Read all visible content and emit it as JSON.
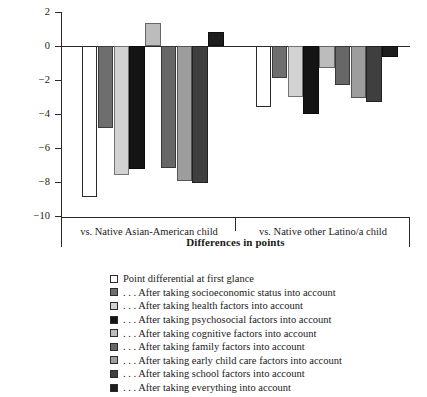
{
  "chart_data": {
    "type": "bar",
    "title": "",
    "xlabel": "Differences in points",
    "ylabel": "",
    "ylim": [
      -10,
      2
    ],
    "ytick_values": [
      2,
      0,
      -2,
      -4,
      -6,
      -8,
      -10
    ],
    "ytick_labels": [
      "2",
      "0",
      "−2",
      "−4",
      "−6",
      "−8",
      "−10"
    ],
    "grid": false,
    "legend_position": "below",
    "categories": [
      "vs. Native Asian-American child",
      "vs. Native other Latino/a child"
    ],
    "series": [
      {
        "name": "Point differential at first glance",
        "color": "#ffffff",
        "values": [
          -8.9,
          -3.6
        ]
      },
      {
        "name": ". . . After taking socioeconomic status into account",
        "color": "#6e6e6e",
        "values": [
          -4.8,
          -1.9
        ]
      },
      {
        "name": ". . . After taking health factors into account",
        "color": "#d2d2d2",
        "values": [
          -7.6,
          -3.0
        ]
      },
      {
        "name": ". . . After taking psychosocial factors into account",
        "color": "#141414",
        "values": [
          -7.25,
          -4.0
        ]
      },
      {
        "name": ". . . After taking cognitive factors into account",
        "color": "#bcbcbc",
        "values": [
          1.35,
          -1.3
        ]
      },
      {
        "name": ". . . After taking family factors into account",
        "color": "#676767",
        "values": [
          -7.2,
          -2.3
        ]
      },
      {
        "name": ". . . After taking early child care factors into account",
        "color": "#9d9d9d",
        "values": [
          -7.95,
          -3.05
        ]
      },
      {
        "name": ". . . After taking school factors into account",
        "color": "#3f3f3f",
        "values": [
          -8.05,
          -3.3
        ]
      },
      {
        "name": ". . . After taking everything into account",
        "color": "#1d1d1d",
        "values": [
          0.85,
          -0.65
        ]
      }
    ]
  },
  "legend": {
    "items": [
      {
        "label": "Point differential at first glance",
        "color": "#ffffff"
      },
      {
        "label": ". . . After taking socioeconomic status into account",
        "color": "#6e6e6e"
      },
      {
        "label": ". . . After taking health factors into account",
        "color": "#d2d2d2"
      },
      {
        "label": ". . . After taking psychosocial factors into account",
        "color": "#141414"
      },
      {
        "label": ". . . After taking cognitive factors into account",
        "color": "#bcbcbc"
      },
      {
        "label": ". . . After taking family factors into account",
        "color": "#676767"
      },
      {
        "label": ". . . After taking early child care factors into account",
        "color": "#9d9d9d"
      },
      {
        "label": ". . . After taking school factors into account",
        "color": "#3f3f3f"
      },
      {
        "label": ". . . After taking everything into account",
        "color": "#1d1d1d"
      }
    ]
  }
}
